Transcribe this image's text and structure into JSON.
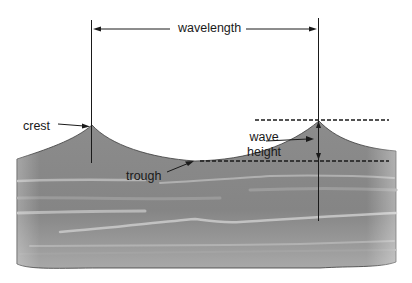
{
  "diagram": {
    "labels": {
      "wavelength": "wavelength",
      "crest": "crest",
      "trough": "trough",
      "wave_height_line1": "wave",
      "wave_height_line2": "height"
    },
    "colors": {
      "background": "#ffffff",
      "water": "#8a8a8a",
      "water_dark": "#7a7a7a",
      "water_streak": "#b8b8b8",
      "line": "#1a1a1a"
    },
    "geometry": {
      "crest_left": [
        92,
        125
      ],
      "crest_right": [
        319,
        121
      ],
      "trough_level_y": 161,
      "crest_level_y": 120,
      "wavelength_arrow_y": 29
    }
  }
}
